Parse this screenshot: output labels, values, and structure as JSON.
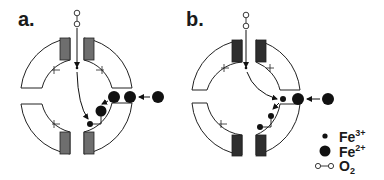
{
  "panels": [
    {
      "label": "a."
    },
    {
      "label": "b."
    }
  ],
  "legend": {
    "items": [
      {
        "symbol": "small-filled-circle",
        "species": "Fe",
        "charge": "3+"
      },
      {
        "symbol": "large-filled-circle",
        "species": "Fe",
        "charge": "2+"
      },
      {
        "symbol": "open-dumbbell",
        "species": "O",
        "subscript": "2"
      }
    ]
  },
  "colors": {
    "stroke": "#222222",
    "gray_block_a": "#6e6e6e",
    "gray_block_b": "#2e2e2e",
    "fill": "#111111",
    "background": "#ffffff"
  }
}
